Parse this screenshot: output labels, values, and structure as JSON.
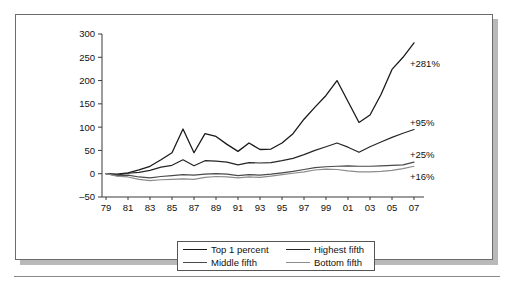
{
  "figure": {
    "frame_border_color": "#6b6b6b",
    "background": "#ffffff"
  },
  "chart_data": {
    "type": "line",
    "title": "",
    "subtitle": "",
    "xlabel": "",
    "ylabel": "",
    "xlim": [
      1979,
      2007
    ],
    "ylim": [
      -50,
      300
    ],
    "grid": false,
    "legend_position": "bottom-center",
    "x": [
      1979,
      1980,
      1981,
      1982,
      1983,
      1984,
      1985,
      1986,
      1987,
      1988,
      1989,
      1990,
      1991,
      1992,
      1993,
      1994,
      1995,
      1996,
      1997,
      1998,
      1999,
      2000,
      2001,
      2002,
      2003,
      2004,
      2005,
      2006,
      2007
    ],
    "xtick_labels": [
      "79",
      "81",
      "83",
      "85",
      "87",
      "89",
      "91",
      "93",
      "95",
      "97",
      "99",
      "01",
      "03",
      "05",
      "07"
    ],
    "xtick_values": [
      1979,
      1981,
      1983,
      1985,
      1987,
      1989,
      1991,
      1993,
      1995,
      1997,
      1999,
      2001,
      2003,
      2005,
      2007
    ],
    "ytick_labels": [
      "300",
      "250",
      "200",
      "150",
      "100",
      "50",
      "0",
      "–50"
    ],
    "ytick_values": [
      300,
      250,
      200,
      150,
      100,
      50,
      0,
      -50
    ],
    "series": [
      {
        "name": "Top 1 percent",
        "color": "#1a1a1a",
        "width": 1.3,
        "end_label": "+281%",
        "values": [
          0,
          -1,
          2,
          8,
          16,
          30,
          45,
          96,
          45,
          86,
          80,
          63,
          48,
          66,
          52,
          53,
          66,
          86,
          117,
          143,
          168,
          200,
          155,
          110,
          126,
          170,
          224,
          250,
          281
        ]
      },
      {
        "name": "Highest fifth",
        "color": "#262626",
        "width": 1.2,
        "end_label": "+95%",
        "values": [
          0,
          -3,
          1,
          3,
          7,
          14,
          18,
          30,
          17,
          28,
          27,
          25,
          19,
          24,
          23,
          24,
          28,
          33,
          41,
          50,
          58,
          66,
          57,
          46,
          58,
          68,
          78,
          87,
          95
        ]
      },
      {
        "name": "Middle fifth",
        "color": "#4a4a4a",
        "width": 1.2,
        "end_label": "+25%",
        "values": [
          0,
          -4,
          -3,
          -7,
          -9,
          -6,
          -4,
          -2,
          -3,
          -1,
          0,
          -1,
          -4,
          -2,
          -3,
          -1,
          2,
          5,
          9,
          13,
          15,
          16,
          17,
          16,
          16,
          17,
          18,
          19,
          25
        ]
      },
      {
        "name": "Bottom fifth",
        "color": "#8c8c8c",
        "width": 1.2,
        "end_label": "+16%",
        "values": [
          0,
          -5,
          -7,
          -12,
          -15,
          -13,
          -12,
          -11,
          -12,
          -8,
          -6,
          -7,
          -9,
          -7,
          -8,
          -5,
          -2,
          1,
          4,
          8,
          10,
          9,
          6,
          4,
          4,
          5,
          7,
          11,
          16
        ]
      }
    ],
    "annotations": [
      {
        "text": "+281%",
        "series": "Top 1 percent",
        "x": 409,
        "y": 66
      },
      {
        "text": "+95%",
        "series": "Highest fifth",
        "x": 409,
        "y": 125
      },
      {
        "text": "+25%",
        "series": "Middle fifth",
        "x": 409,
        "y": 157
      },
      {
        "text": "+16%",
        "series": "Bottom fifth",
        "x": 409,
        "y": 179
      }
    ]
  },
  "legend": {
    "rows": [
      [
        {
          "label": "Top 1 percent",
          "color": "#1a1a1a",
          "width": 1.6
        },
        {
          "label": "Highest fifth",
          "color": "#262626",
          "width": 1.4
        }
      ],
      [
        {
          "label": "Middle fifth",
          "color": "#4a4a4a",
          "width": 1.2
        },
        {
          "label": "Bottom fifth",
          "color": "#8c8c8c",
          "width": 1.2
        }
      ]
    ]
  }
}
